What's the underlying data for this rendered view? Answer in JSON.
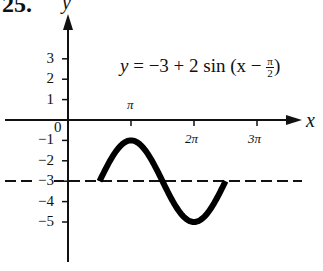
{
  "problem_number": "25.",
  "chart_data": {
    "type": "line",
    "equation": {
      "lhs": "y",
      "rhs_prefix": "−3 + 2 sin (x −",
      "frac_num": "π",
      "frac_den": "2",
      "rhs_suffix": ")"
    },
    "xlabel": "x",
    "ylabel": "y",
    "x_ticks": [
      {
        "value": 3.14159,
        "label": "π"
      },
      {
        "value": 6.28318,
        "label": "2π"
      },
      {
        "value": 9.42478,
        "label": "3π"
      }
    ],
    "y_ticks": [
      {
        "value": 3,
        "label": "3"
      },
      {
        "value": 2,
        "label": "2"
      },
      {
        "value": 1,
        "label": "1"
      },
      {
        "value": -1,
        "label": "−1"
      },
      {
        "value": -2,
        "label": "−2"
      },
      {
        "value": -3,
        "label": "−3"
      },
      {
        "value": -4,
        "label": "−4"
      },
      {
        "value": -5,
        "label": "−5"
      }
    ],
    "origin_label": "0",
    "series": [
      {
        "name": "y = −3 + 2 sin (x − π/2)",
        "style": "thick solid",
        "x_range": [
          1.5708,
          7.854
        ],
        "points": [
          {
            "x": 1.5708,
            "y": -3
          },
          {
            "x": 3.14159,
            "y": -1
          },
          {
            "x": 4.7124,
            "y": -3
          },
          {
            "x": 6.28318,
            "y": -5
          },
          {
            "x": 7.854,
            "y": -3
          }
        ]
      },
      {
        "name": "midline y = −3",
        "style": "dashed",
        "y": -3
      }
    ],
    "xlim": [
      -1.1,
      11.8
    ],
    "ylim": [
      -6.8,
      5.2
    ],
    "grid": false,
    "legend": "none"
  }
}
